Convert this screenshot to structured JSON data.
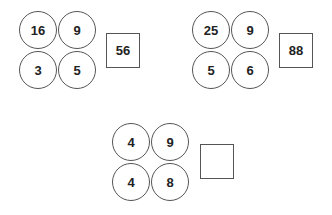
{
  "puzzles": [
    {
      "circles": [
        "16",
        "9",
        "3",
        "5"
      ],
      "answer": "56"
    },
    {
      "circles": [
        "25",
        "9",
        "5",
        "6"
      ],
      "answer": "88"
    },
    {
      "circles": [
        "4",
        "9",
        "4",
        "8"
      ],
      "answer": ""
    }
  ],
  "colors": {
    "stroke": "#555555",
    "text": "#222222",
    "background": "#ffffff"
  }
}
